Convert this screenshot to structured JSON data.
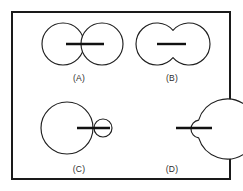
{
  "figure": {
    "canvas": {
      "width": 243,
      "height": 191,
      "background": "#ffffff"
    },
    "frame": {
      "x": 11,
      "y": 11,
      "width": 220,
      "height": 169,
      "stroke": "#1a1a1a",
      "stroke_width": 2,
      "fill": "#ffffff"
    },
    "style": {
      "outline_color": "#1f1f1f",
      "outline_width": 1.15,
      "marker_color": "#111111",
      "marker_width": 2.4,
      "label_color": "#2b2b2b",
      "label_font_size": 8.5
    },
    "panels": [
      {
        "id": "A",
        "label": "(A)",
        "description": "Two equal circles touching at a single tangent point, horizontal bar through the tangency",
        "label_x": 79,
        "label_y": 81,
        "circles": [
          {
            "cx": 63,
            "cy": 44,
            "r": 21
          },
          {
            "cx": 102,
            "cy": 44,
            "r": 21
          }
        ],
        "marker": {
          "x1": 66,
          "y1": 44,
          "x2": 104,
          "y2": 44
        }
      },
      {
        "id": "B",
        "label": "(B)",
        "description": "Two circles fully merged into a single peanut outline with shallow waist, short horizontal bar at center",
        "label_x": 172,
        "label_y": 81,
        "union_circles": [
          {
            "cx": 157,
            "cy": 44,
            "r": 21
          },
          {
            "cx": 189,
            "cy": 44,
            "r": 21
          }
        ],
        "marker": {
          "x1": 157,
          "y1": 44,
          "x2": 186,
          "y2": 44
        }
      },
      {
        "id": "C",
        "label": "(C)",
        "description": "Large circle with a small circle overlapping its right edge, horizontal bar spanning from large circle into the small one",
        "label_x": 79,
        "label_y": 172,
        "circles": [
          {
            "cx": 67,
            "cy": 128,
            "r": 26
          },
          {
            "cx": 103,
            "cy": 128,
            "r": 9
          }
        ],
        "marker": {
          "x1": 77,
          "y1": 128,
          "x2": 110,
          "y2": 128
        }
      },
      {
        "id": "D",
        "label": "(D)",
        "description": "Large circle with a small inward notch on its right side, horizontal bar crossing the notch",
        "label_x": 172,
        "label_y": 172,
        "main_circle": {
          "cx": 170,
          "cy": 129,
          "r": 30
        },
        "notch": {
          "cx": 200,
          "cy": 129,
          "r": 9
        },
        "marker": {
          "x1": 176,
          "y1": 128,
          "x2": 212,
          "y2": 128
        }
      }
    ]
  }
}
